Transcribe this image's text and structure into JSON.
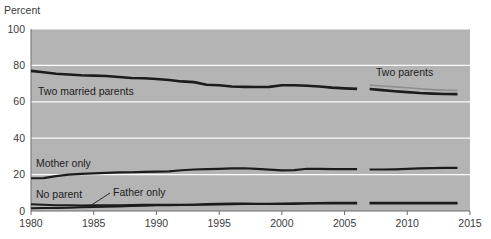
{
  "chart_data": {
    "type": "line",
    "title": "",
    "subtitle": "",
    "xlabel": "",
    "ylabel": "Percent",
    "xlim": [
      1980,
      2015
    ],
    "ylim": [
      0,
      100
    ],
    "grid": true,
    "grid_color": "#ffffff",
    "plot_background": "#b4b4b4",
    "legend_position": "inline-annotations",
    "x_ticks": [
      "1980",
      "1985",
      "1990",
      "1995",
      "2000",
      "2005",
      "2010",
      "2015"
    ],
    "x_tick_values": [
      1980,
      1985,
      1990,
      1995,
      2000,
      2005,
      2010,
      2015
    ],
    "y_ticks": [
      "0",
      "20",
      "40",
      "60",
      "80",
      "100"
    ],
    "y_tick_values": [
      0,
      20,
      40,
      60,
      80,
      100
    ],
    "series_break_years": [
      2006,
      2007
    ],
    "series": [
      {
        "name": "Two married parents",
        "color": "#1c1c1c",
        "width": 2.6,
        "x": [
          1980,
          1981,
          1982,
          1983,
          1984,
          1985,
          1986,
          1987,
          1988,
          1989,
          1990,
          1991,
          1992,
          1993,
          1994,
          1995,
          1996,
          1997,
          1998,
          1999,
          2000,
          2001,
          2002,
          2003,
          2004,
          2005,
          2006
        ],
        "values": [
          77.0,
          76.2,
          75.4,
          75.0,
          74.6,
          74.4,
          74.2,
          73.6,
          73.1,
          72.9,
          72.5,
          72.0,
          71.2,
          70.8,
          69.4,
          69.1,
          68.4,
          68.2,
          68.1,
          68.2,
          69.1,
          69.1,
          68.8,
          68.4,
          67.8,
          67.4,
          67.1
        ]
      },
      {
        "name": "Two married parents (after break)",
        "color": "#1c1c1c",
        "width": 2.6,
        "x": [
          2007,
          2008,
          2009,
          2010,
          2011,
          2012,
          2013,
          2014
        ],
        "values": [
          67.0,
          66.4,
          65.8,
          65.3,
          64.8,
          64.5,
          64.3,
          64.2
        ]
      },
      {
        "name": "Two parents",
        "color": "#8f8f8f",
        "width": 1.6,
        "x": [
          2007,
          2008,
          2009,
          2010,
          2011,
          2012,
          2013,
          2014
        ],
        "values": [
          69.2,
          68.7,
          68.2,
          67.7,
          67.2,
          66.7,
          66.4,
          66.3
        ]
      },
      {
        "name": "Mother only",
        "color": "#1c1c1c",
        "width": 2.2,
        "x": [
          1980,
          1981,
          1982,
          1983,
          1984,
          1985,
          1986,
          1987,
          1988,
          1989,
          1990,
          1991,
          1992,
          1993,
          1994,
          1995,
          1996,
          1997,
          1998,
          1999,
          2000,
          2001,
          2002,
          2003,
          2004,
          2005,
          2006
        ],
        "values": [
          18.0,
          18.1,
          19.2,
          20.0,
          20.4,
          20.7,
          20.9,
          21.2,
          21.3,
          21.5,
          21.6,
          21.8,
          22.4,
          22.8,
          23.0,
          23.2,
          23.4,
          23.5,
          23.2,
          22.7,
          22.3,
          22.5,
          23.2,
          23.1,
          23.0,
          23.0,
          23.0
        ]
      },
      {
        "name": "Mother only (after break)",
        "color": "#1c1c1c",
        "width": 2.2,
        "x": [
          2007,
          2008,
          2009,
          2010,
          2011,
          2012,
          2013,
          2014
        ],
        "values": [
          22.8,
          22.8,
          22.9,
          23.1,
          23.4,
          23.6,
          23.7,
          23.7
        ]
      },
      {
        "name": "No parent",
        "color": "#1c1c1c",
        "width": 2.0,
        "x": [
          1980,
          1981,
          1982,
          1983,
          1984,
          1985,
          1986,
          1987,
          1988,
          1989,
          1990,
          1991,
          1992,
          1993,
          1994,
          1995,
          1996,
          1997,
          1998,
          1999,
          2000,
          2001,
          2002,
          2003,
          2004,
          2005,
          2006
        ],
        "values": [
          3.7,
          3.4,
          3.2,
          3.1,
          3.0,
          3.1,
          3.2,
          3.2,
          3.3,
          3.4,
          3.4,
          3.5,
          3.5,
          3.5,
          3.8,
          4.0,
          4.1,
          4.1,
          4.0,
          3.9,
          3.8,
          3.9,
          4.1,
          4.1,
          4.1,
          4.1,
          4.1
        ]
      },
      {
        "name": "No parent (after break)",
        "color": "#1c1c1c",
        "width": 2.0,
        "x": [
          2007,
          2008,
          2009,
          2010,
          2011,
          2012,
          2013,
          2014
        ],
        "values": [
          4.1,
          4.1,
          4.1,
          4.1,
          4.1,
          4.1,
          4.1,
          4.1
        ]
      },
      {
        "name": "Father only",
        "color": "#1c1c1c",
        "width": 2.0,
        "x": [
          1980,
          1981,
          1982,
          1983,
          1984,
          1985,
          1986,
          1987,
          1988,
          1989,
          1990,
          1991,
          1992,
          1993,
          1994,
          1995,
          1996,
          1997,
          1998,
          1999,
          2000,
          2001,
          2002,
          2003,
          2004,
          2005,
          2006
        ],
        "values": [
          1.5,
          1.6,
          1.7,
          1.8,
          2.0,
          2.2,
          2.4,
          2.5,
          2.7,
          2.9,
          3.1,
          3.2,
          3.3,
          3.4,
          3.5,
          3.6,
          3.7,
          3.8,
          3.9,
          4.0,
          4.1,
          4.2,
          4.3,
          4.4,
          4.5,
          4.5,
          4.5
        ]
      },
      {
        "name": "Father only (after break)",
        "color": "#1c1c1c",
        "width": 2.0,
        "x": [
          2007,
          2008,
          2009,
          2010,
          2011,
          2012,
          2013,
          2014
        ],
        "values": [
          4.5,
          4.5,
          4.5,
          4.6,
          4.6,
          4.6,
          4.6,
          4.6
        ]
      }
    ],
    "annotations": [
      {
        "key": "two_married_parents",
        "text": "Two married parents",
        "x": 38,
        "y": 95
      },
      {
        "key": "two_parents",
        "text": "Two parents",
        "x": 376,
        "y": 76
      },
      {
        "key": "mother_only",
        "text": "Mother only",
        "x": 36,
        "y": 167
      },
      {
        "key": "no_parent",
        "text": "No parent",
        "x": 36,
        "y": 198
      },
      {
        "key": "father_only",
        "text": "Father only",
        "x": 113,
        "y": 196
      }
    ],
    "leader_line": {
      "key": "father-only-leader",
      "x1": 110,
      "y1": 193,
      "x2": 90,
      "y2": 206
    }
  }
}
